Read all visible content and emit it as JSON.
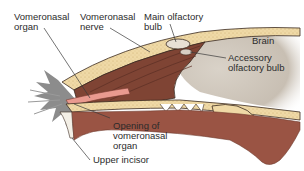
{
  "diagram": {
    "labels": {
      "vomeronasal_organ": "Vomeronasal\norgan",
      "vomeronasal_nerve": "Vomeronasal\nnerve",
      "main_olfactory_bulb": "Main olfactory\nbulb",
      "brain": "Brain",
      "accessory_olfactory_bulb": "Accessory\nolfactory bulb",
      "opening_of_vomeronasal_organ": "Opening of\nvomeronasal\norgan",
      "upper_incisor": "Upper incisor"
    },
    "colors": {
      "tissue": "#8a4a3a",
      "tissue_dark": "#6e3a2e",
      "bone": "#efd9a6",
      "outline": "#3a2a20",
      "brain": "#cfc7bd",
      "organ": "#e99a8f",
      "fur": "#8c8c8c",
      "label_text": "#2b2b2b"
    }
  }
}
